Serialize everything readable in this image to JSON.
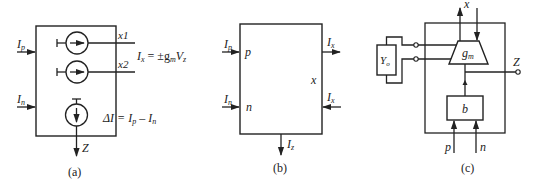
{
  "figure": {
    "panels": [
      {
        "id": "a",
        "caption": "(a)",
        "inputs": [
          {
            "label_main": "I",
            "label_sub": "p"
          },
          {
            "label_main": "I",
            "label_sub": "n"
          }
        ],
        "outputs": [
          {
            "label": "x1"
          },
          {
            "label": "x2"
          }
        ],
        "equation_ix": {
          "lhs_main": "I",
          "lhs_sub": "x",
          "rhs": " = ±g",
          "rhs_sub": "m",
          "rhs2": "V",
          "rhs2_sub": "z"
        },
        "equation_delta": {
          "text1": "ΔI = I",
          "sub1": "p",
          "text2": " – I",
          "sub2": "n"
        },
        "z_label": "Z"
      },
      {
        "id": "b",
        "caption": "(b)",
        "inputs": [
          {
            "label_main": "I",
            "label_sub": "p",
            "port": "p"
          },
          {
            "label_main": "I",
            "label_sub": "n",
            "port": "n"
          }
        ],
        "outputs": [
          {
            "label_main": "I",
            "label_sub": "x",
            "direction": "out"
          },
          {
            "label_main": "I",
            "label_sub": "x",
            "direction": "in"
          }
        ],
        "x_port": "x",
        "z_output": {
          "label_main": "I",
          "label_sub": "z"
        }
      },
      {
        "id": "c",
        "caption": "(c)",
        "x_label": "x",
        "z_label": "Z",
        "admittance_label_main": "Y",
        "admittance_label_sub": "o",
        "transconductor_label_main": "g",
        "transconductor_label_sub": "m",
        "buffer_label": "b",
        "input_p": "p",
        "input_n": "n"
      }
    ]
  }
}
